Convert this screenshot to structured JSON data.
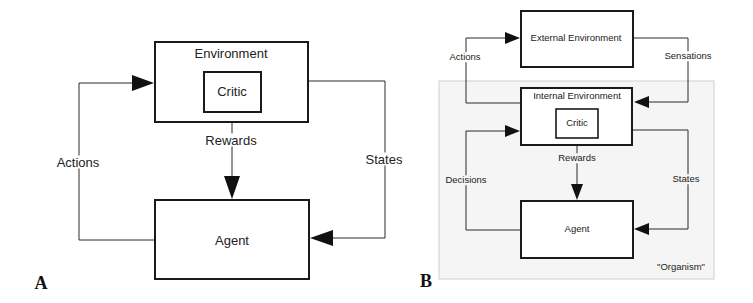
{
  "panel_a": {
    "panel_label": "A",
    "nodes": {
      "environment": "Environment",
      "critic": "Critic",
      "agent": "Agent"
    },
    "edges": {
      "actions": "Actions",
      "rewards": "Rewards",
      "states": "States"
    }
  },
  "panel_b": {
    "panel_label": "B",
    "region_label": "\"Organism\"",
    "nodes": {
      "external_environment": "External Environment",
      "internal_environment": "Internal Environment",
      "critic": "Critic",
      "agent": "Agent"
    },
    "edges": {
      "actions": "Actions",
      "sensations": "Sensations",
      "decisions": "Decisions",
      "rewards": "Rewards",
      "states": "States"
    }
  },
  "colors": {
    "stroke": "#1a1a1a",
    "organism_fill": "#f5f5f5",
    "background": "#ffffff"
  }
}
